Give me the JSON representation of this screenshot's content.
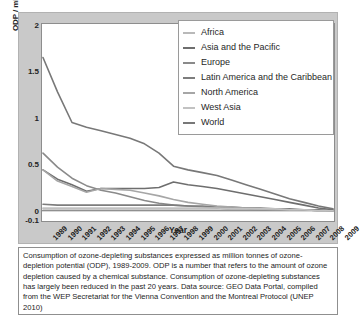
{
  "figure": {
    "caption": "Consumption of ozone-depleting substances expressed as million tonnes of ozone-depletion potential (ODP), 1989-2009. ODP is a number that refers to the amount of ozone depletion caused by a chemical substance. Consumption of ozone-depleting substances has largely been reduced in the past 20 years. Data source: GEO Data Portal, compiled from the WEP Secretariat for the Vienna Convention and the Montreal Protocol (UNEP 2010)"
  },
  "chart_data": {
    "type": "line",
    "title": "",
    "xlabel": "Year",
    "ylabel": "ODP / million tonnes",
    "x": [
      1989,
      1990,
      1991,
      1992,
      1993,
      1994,
      1995,
      1996,
      1997,
      1998,
      1999,
      2000,
      2001,
      2002,
      2003,
      2004,
      2005,
      2006,
      2007,
      2008,
      2009
    ],
    "categories": [
      "1989",
      "1990",
      "1991",
      "1992",
      "1993",
      "1994",
      "1995",
      "1996",
      "1997",
      "1998",
      "1999",
      "2000",
      "2001",
      "2002",
      "2003",
      "2004",
      "2005",
      "2006",
      "2007",
      "2008",
      "2009"
    ],
    "xlim": [
      1989,
      2009
    ],
    "ylim": [
      -0.1,
      2
    ],
    "yticks": [
      -0.1,
      0,
      0.5,
      1,
      1.5,
      2
    ],
    "ytick_labels": [
      "-0.1",
      "0",
      "0.5",
      "1",
      "1.5",
      "2"
    ],
    "grid": false,
    "legend_position": "top-right",
    "series": [
      {
        "name": "Africa",
        "color": "#b9b9b9",
        "values": [
          0.02,
          0.02,
          0.02,
          0.02,
          0.02,
          0.02,
          0.02,
          0.02,
          0.02,
          0.02,
          0.02,
          0.02,
          0.02,
          0.02,
          0.02,
          0.02,
          0.01,
          0.01,
          0.01,
          0.01,
          0.0
        ]
      },
      {
        "name": "Asia and the Pacific",
        "color": "#6e6e6e",
        "values": [
          0.44,
          0.34,
          0.28,
          0.21,
          0.24,
          0.24,
          0.24,
          0.24,
          0.25,
          0.31,
          0.28,
          0.26,
          0.24,
          0.21,
          0.18,
          0.15,
          0.12,
          0.09,
          0.06,
          0.03,
          0.01
        ]
      },
      {
        "name": "Europe",
        "color": "#8a8a8a",
        "values": [
          0.62,
          0.47,
          0.35,
          0.27,
          0.22,
          0.19,
          0.15,
          0.11,
          0.08,
          0.06,
          0.05,
          0.04,
          0.03,
          0.02,
          0.02,
          0.01,
          0.01,
          0.01,
          0.01,
          0.0,
          0.0
        ]
      },
      {
        "name": "Latin America and the Caribbean",
        "color": "#7d7d7d",
        "values": [
          0.07,
          0.06,
          0.06,
          0.06,
          0.06,
          0.06,
          0.06,
          0.06,
          0.06,
          0.06,
          0.05,
          0.05,
          0.04,
          0.04,
          0.03,
          0.03,
          0.02,
          0.02,
          0.01,
          0.01,
          0.0
        ]
      },
      {
        "name": "North America",
        "color": "#a6a6a6",
        "values": [
          0.44,
          0.32,
          0.26,
          0.2,
          0.24,
          0.23,
          0.22,
          0.19,
          0.16,
          0.12,
          0.09,
          0.07,
          0.05,
          0.04,
          0.03,
          0.02,
          0.02,
          0.01,
          0.01,
          0.0,
          0.0
        ]
      },
      {
        "name": "West Asia",
        "color": "#c2c2c2",
        "values": [
          0.03,
          0.03,
          0.03,
          0.03,
          0.03,
          0.03,
          0.03,
          0.03,
          0.03,
          0.03,
          0.03,
          0.03,
          0.03,
          0.02,
          0.02,
          0.02,
          0.02,
          0.01,
          0.01,
          0.0,
          0.0
        ]
      },
      {
        "name": "World",
        "color": "#787878",
        "values": [
          1.65,
          1.28,
          0.95,
          0.9,
          0.86,
          0.82,
          0.78,
          0.72,
          0.62,
          0.48,
          0.44,
          0.41,
          0.38,
          0.33,
          0.28,
          0.23,
          0.18,
          0.13,
          0.09,
          0.05,
          0.02
        ]
      }
    ]
  }
}
